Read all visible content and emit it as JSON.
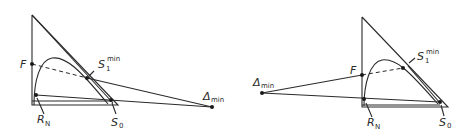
{
  "figure": {
    "panels": [
      {
        "id": "left",
        "labels": {
          "F": "F",
          "S1": "S",
          "S1_sub": "1",
          "S1_sup": "min",
          "delta": "Δ",
          "delta_sub": "min",
          "RN": "R",
          "RN_sub": "N",
          "S0": "S",
          "S0_sub": "0"
        }
      },
      {
        "id": "right",
        "labels": {
          "F": "F",
          "S1": "S",
          "S1_sub": "1",
          "S1_sup": "min",
          "delta": "Δ",
          "delta_sub": "min",
          "RN": "R",
          "RN_sub": "N",
          "S0": "S",
          "S0_sub": "0"
        }
      }
    ]
  }
}
